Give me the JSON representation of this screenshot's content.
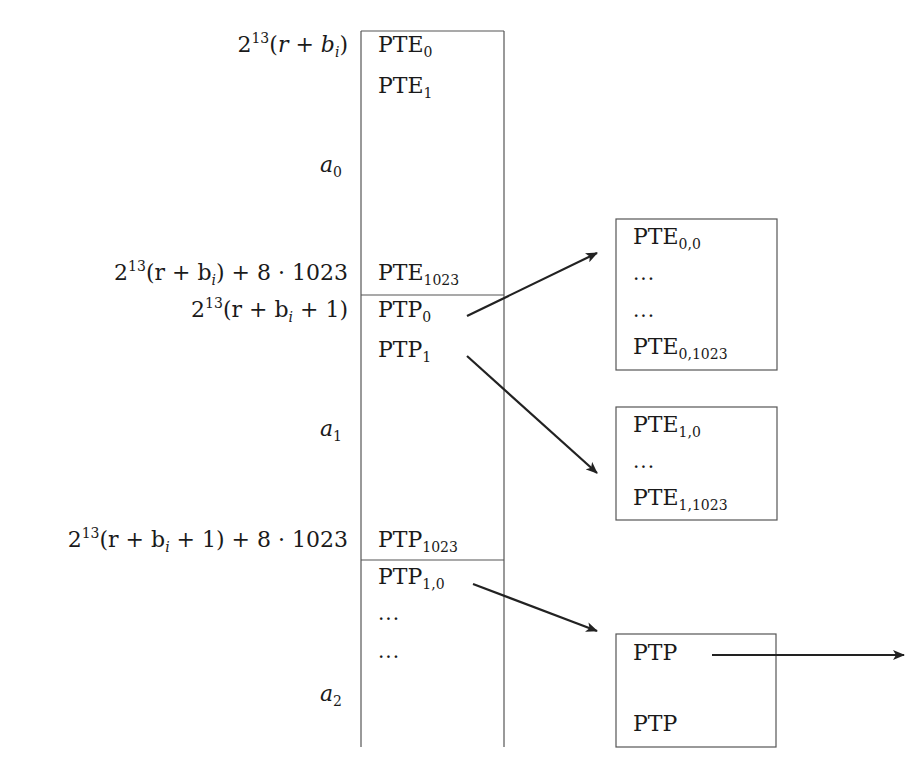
{
  "address_labels": {
    "base": {
      "coef": "2",
      "exp": "13",
      "open": "(",
      "var_r": "r",
      "plus": " + ",
      "var_b": "b",
      "sub_i": "i",
      "close": ")"
    },
    "base_end": {
      "coef": "2",
      "exp": "13",
      "text": "(r + b",
      "sub_i": "i",
      "tail": ") + 8 · 1023"
    },
    "next_base": {
      "coef": "2",
      "exp": "13",
      "text": "(r + b",
      "sub_i": "i",
      "tail": " + 1)"
    },
    "next_base_end": {
      "coef": "2",
      "exp": "13",
      "text": "(r + b",
      "sub_i": "i",
      "tail": " + 1) + 8 · 1023"
    },
    "a0": {
      "var": "a",
      "sub": "0"
    },
    "a1": {
      "var": "a",
      "sub": "1"
    },
    "a2": {
      "var": "a",
      "sub": "2"
    }
  },
  "main_column": {
    "entries": [
      {
        "name": "PTE",
        "sub": "0"
      },
      {
        "name": "PTE",
        "sub": "1"
      },
      {
        "name": "PTE",
        "sub": "1023"
      },
      {
        "name": "PTP",
        "sub": "0"
      },
      {
        "name": "PTP",
        "sub": "1"
      },
      {
        "name": "PTP",
        "sub": "1023"
      },
      {
        "name": "PTP",
        "sub": "1,0"
      },
      {
        "dots": "..."
      },
      {
        "dots": "..."
      }
    ]
  },
  "table_box_0": {
    "entries": [
      {
        "name": "PTE",
        "sub": "0,0"
      },
      {
        "dots": "..."
      },
      {
        "dots": "..."
      },
      {
        "name": "PTE",
        "sub": "0,1023"
      }
    ]
  },
  "table_box_1": {
    "entries": [
      {
        "name": "PTE",
        "sub": "1,0"
      },
      {
        "dots": "..."
      },
      {
        "name": "PTE",
        "sub": "1,1023"
      }
    ]
  },
  "ptp_box": {
    "entries": [
      {
        "name": "PTP"
      },
      {
        "name": "PTP"
      }
    ]
  },
  "colors": {
    "line": "#555555",
    "arrow": "#222222",
    "text": "#1a1a1a"
  }
}
